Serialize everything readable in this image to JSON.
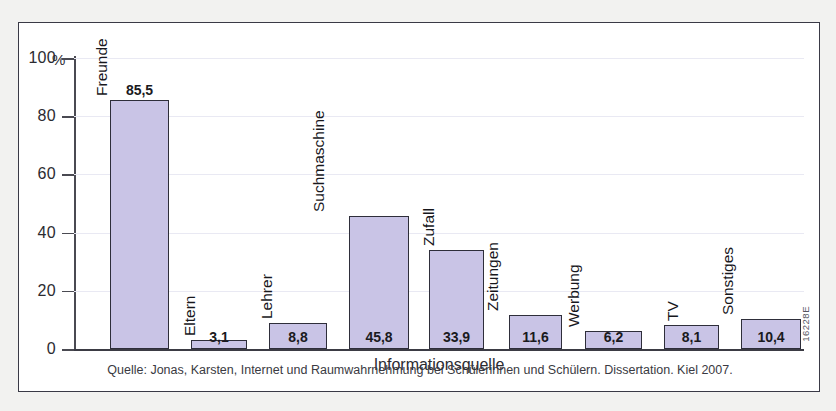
{
  "chart_data": {
    "type": "bar",
    "title": "",
    "xlabel": "Informationsquelle",
    "ylabel": "%",
    "unit": "%",
    "ylim": [
      0,
      100
    ],
    "yticks": [
      0,
      20,
      40,
      60,
      80,
      100
    ],
    "ytick_labels": [
      "0",
      "20",
      "40",
      "60",
      "80",
      "100"
    ],
    "grid": true,
    "legend": null,
    "categories": [
      "Freunde",
      "Eltern",
      "Lehrer",
      "Suchmaschine",
      "Zufall",
      "Zeitungen",
      "Werbung",
      "TV",
      "Sonstiges"
    ],
    "values": [
      85.5,
      3.1,
      8.8,
      45.8,
      33.9,
      11.6,
      6.2,
      8.1,
      10.4
    ],
    "value_labels": [
      "85,5",
      "3,1",
      "8,8",
      "45,8",
      "33,9",
      "11,6",
      "6,2",
      "8,1",
      "10,4"
    ],
    "bar_color": "#c9c4e6",
    "bar_border_color": "#2e2e3a"
  },
  "source": {
    "text": "Quelle: Jonas, Karsten, Internet und Raumwahrnehmung bei Schülerinnen und Schülern. Dissertation. Kiel 2007."
  },
  "code": {
    "id": "16228E"
  }
}
